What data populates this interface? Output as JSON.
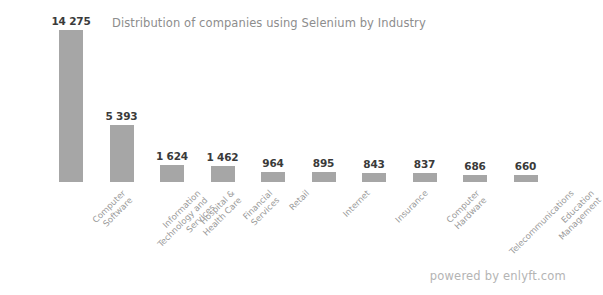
{
  "chart_data": {
    "type": "bar",
    "title": "Distribution of companies using Selenium by Industry",
    "xlabel": "",
    "ylabel": "",
    "ylim": [
      0,
      14275
    ],
    "grid": false,
    "legend": null,
    "orientation": "vertical",
    "bar_color": "#a6a6a6",
    "background_color": "#ffffff",
    "categories": [
      "Computer Software",
      "Information Technology and Services",
      "Hospital & Health Care",
      "Financial Services",
      "Retail",
      "Internet",
      "Insurance",
      "Computer Hardware",
      "Telecommunications",
      "Education Management"
    ],
    "values": [
      14275,
      5393,
      1624,
      1462,
      964,
      895,
      843,
      837,
      686,
      660
    ],
    "value_labels": [
      "14 275",
      "5 393",
      "1 624",
      "1 462",
      "964",
      "895",
      "843",
      "837",
      "686",
      "660"
    ],
    "category_label_lines": [
      [
        "Computer",
        "Software"
      ],
      [
        "Information",
        "Technology and",
        "Services"
      ],
      [
        "Hospital &",
        "Health Care"
      ],
      [
        "Financial",
        "Services"
      ],
      [
        "Retail"
      ],
      [
        "Internet"
      ],
      [
        "Insurance"
      ],
      [
        "Computer",
        "Hardware"
      ],
      [
        "Telecommunications"
      ],
      [
        "Education",
        "Management"
      ]
    ]
  },
  "footer": {
    "credit": "powered by enlyft.com"
  },
  "colors": {
    "bar": "#a6a6a6",
    "title_text": "#8d8d8d",
    "value_text": "#3a3a3a",
    "category_text": "#9a9a9a",
    "footer_text": "#b4b4b4",
    "background": "#ffffff"
  }
}
